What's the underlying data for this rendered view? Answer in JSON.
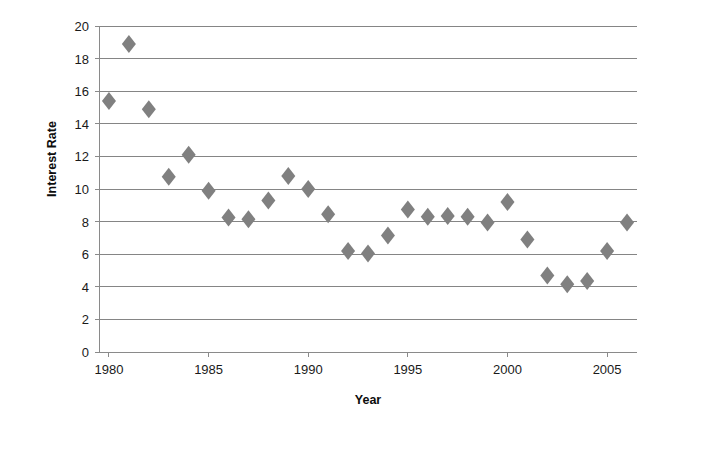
{
  "chart_data": {
    "type": "scatter",
    "title": "",
    "xlabel": "Year",
    "ylabel": "Interest Rate",
    "xlim": [
      1979.5,
      2006.5
    ],
    "ylim": [
      0,
      20
    ],
    "grid": true,
    "legend": "none",
    "marker": {
      "shape": "diamond",
      "color": "#808080",
      "size": 9
    },
    "xticks": [
      1980,
      1985,
      1990,
      1995,
      2000,
      2005
    ],
    "xtick_labels": [
      "1980",
      "1985",
      "1990",
      "1995",
      "2000",
      "2005"
    ],
    "yticks": [
      0,
      2,
      4,
      6,
      8,
      10,
      12,
      14,
      16,
      18,
      20
    ],
    "ytick_labels": [
      "0",
      "2",
      "4",
      "6",
      "8",
      "10",
      "12",
      "14",
      "16",
      "18",
      "20"
    ],
    "x": [
      1980,
      1981,
      1982,
      1983,
      1984,
      1985,
      1986,
      1987,
      1988,
      1989,
      1990,
      1991,
      1992,
      1993,
      1994,
      1995,
      1996,
      1997,
      1998,
      1999,
      2000,
      2001,
      2002,
      2003,
      2004,
      2005,
      2006
    ],
    "values": [
      15.4,
      18.9,
      14.9,
      10.75,
      12.1,
      9.9,
      8.25,
      8.15,
      9.3,
      10.8,
      10.0,
      8.45,
      6.2,
      6.05,
      7.15,
      8.75,
      8.3,
      8.35,
      8.3,
      7.95,
      9.2,
      6.9,
      4.7,
      4.15,
      4.35,
      6.2,
      7.95
    ],
    "points": [
      {
        "year": 1980,
        "rate": 15.4
      },
      {
        "year": 1981,
        "rate": 18.9
      },
      {
        "year": 1982,
        "rate": 14.9
      },
      {
        "year": 1983,
        "rate": 10.75
      },
      {
        "year": 1984,
        "rate": 12.1
      },
      {
        "year": 1985,
        "rate": 9.9
      },
      {
        "year": 1986,
        "rate": 8.25
      },
      {
        "year": 1987,
        "rate": 8.15
      },
      {
        "year": 1988,
        "rate": 9.3
      },
      {
        "year": 1989,
        "rate": 10.8
      },
      {
        "year": 1990,
        "rate": 10.0
      },
      {
        "year": 1991,
        "rate": 8.45
      },
      {
        "year": 1992,
        "rate": 6.2
      },
      {
        "year": 1993,
        "rate": 6.05
      },
      {
        "year": 1994,
        "rate": 7.15
      },
      {
        "year": 1995,
        "rate": 8.75
      },
      {
        "year": 1996,
        "rate": 8.3
      },
      {
        "year": 1997,
        "rate": 8.35
      },
      {
        "year": 1998,
        "rate": 8.3
      },
      {
        "year": 1999,
        "rate": 7.95
      },
      {
        "year": 2000,
        "rate": 9.2
      },
      {
        "year": 2001,
        "rate": 6.9
      },
      {
        "year": 2002,
        "rate": 4.7
      },
      {
        "year": 2003,
        "rate": 4.15
      },
      {
        "year": 2004,
        "rate": 4.35
      },
      {
        "year": 2005,
        "rate": 6.2
      },
      {
        "year": 2006,
        "rate": 7.95
      }
    ]
  },
  "colors": {
    "marker": "#808080",
    "gridline": "#858585",
    "axis": "#8a8a8a",
    "text": "#1a1a1a",
    "background": "#ffffff"
  }
}
